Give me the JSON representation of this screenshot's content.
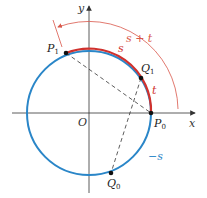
{
  "diagram": {
    "axes": {
      "x_label": "x",
      "y_label": "y",
      "origin_label": "O"
    },
    "points": [
      {
        "name": "P0",
        "label": "P",
        "sub": "0"
      },
      {
        "name": "P1",
        "label": "P",
        "sub": "1"
      },
      {
        "name": "Q0",
        "label": "Q",
        "sub": "0"
      },
      {
        "name": "Q1",
        "label": "Q",
        "sub": "1"
      }
    ],
    "arc_labels": {
      "s": "s",
      "t": "t",
      "s_plus_t": "s + t",
      "neg_s": "−s"
    },
    "colors": {
      "circle": "#2a86c8",
      "arc": "#d0312d",
      "outer_arrow": "#d9574a",
      "axis": "#333333",
      "chord": "#333333"
    }
  }
}
